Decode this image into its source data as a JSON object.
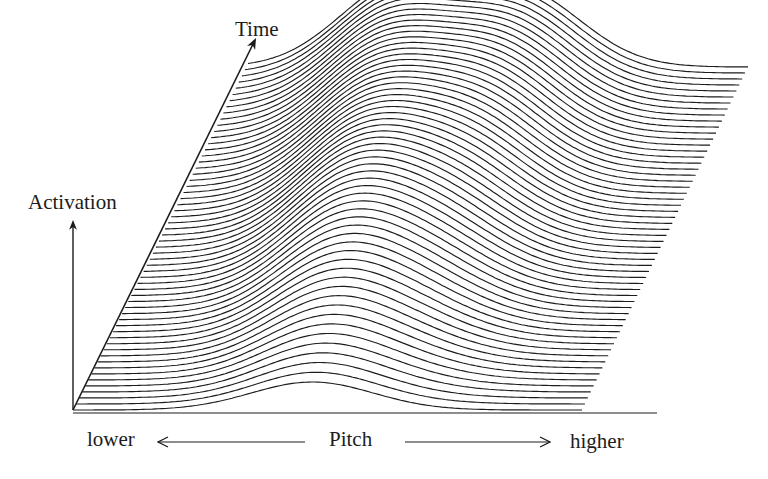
{
  "labels": {
    "time_axis": "Time",
    "activation_axis": "Activation",
    "pitch_axis": "Pitch",
    "pitch_low": "lower",
    "pitch_high": "higher"
  },
  "colors": {
    "background": "#ffffff",
    "ink": "#1c1c1c"
  },
  "chart_data": {
    "type": "waterfall-line",
    "title": "",
    "xlabel": "Pitch (lower ← → higher)",
    "ylabel": "Activation",
    "zlabel": "Time",
    "grid": false,
    "legend": null,
    "n_traces": 58,
    "geometry": {
      "origin": [
        73,
        410
      ],
      "time_axis_end": [
        255,
        40
      ],
      "activation_axis_top": [
        73,
        222
      ],
      "baseline": {
        "y": 413,
        "x0": 73,
        "x1": 657
      },
      "first_trace": {
        "y": 410,
        "x0": 73,
        "x1": 582
      },
      "last_trace": {
        "y": 67,
        "x0": 248,
        "x1": 748
      },
      "pitch_arrow_left": {
        "y": 442,
        "x0": 158,
        "x1": 305
      },
      "pitch_arrow_right": {
        "y": 442,
        "x0": 405,
        "x1": 550
      }
    },
    "peaks": [
      {
        "name": "lower-pitch activation peak",
        "start_trace": 0,
        "end_trace": 57,
        "pitch_center_start": 0.47,
        "pitch_center_end": 0.3,
        "height_start": 28,
        "height_max": 80,
        "height_trace": 30,
        "width": 0.12
      },
      {
        "name": "higher-pitch activation peak",
        "start_trace": 0,
        "end_trace": 57,
        "pitch_center_start": 0.62,
        "pitch_center_end": 0.55,
        "height_start": 0,
        "height_max": 72,
        "height_trace": 52,
        "width": 0.12
      }
    ]
  }
}
